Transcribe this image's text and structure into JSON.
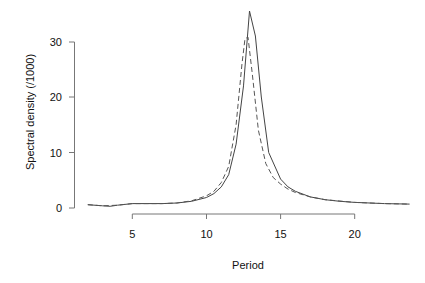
{
  "chart_data": {
    "type": "line",
    "title": "",
    "xlabel": "Period",
    "ylabel": "Spectral density (/1000)",
    "xlim": [
      2,
      23.7
    ],
    "ylim": [
      0,
      36
    ],
    "grid": false,
    "legend": null,
    "x_ticks": [
      5,
      10,
      15,
      20
    ],
    "y_ticks": [
      0,
      10,
      20,
      30
    ],
    "series": [
      {
        "name": "solid",
        "line_style": "solid",
        "color": "#444444",
        "points": [
          [
            2.0,
            0.6
          ],
          [
            3.0,
            0.4
          ],
          [
            3.5,
            0.3
          ],
          [
            4.0,
            0.5
          ],
          [
            5.0,
            0.8
          ],
          [
            6.0,
            0.8
          ],
          [
            7.0,
            0.8
          ],
          [
            8.0,
            0.9
          ],
          [
            9.0,
            1.2
          ],
          [
            10.0,
            1.9
          ],
          [
            10.5,
            2.6
          ],
          [
            11.0,
            3.8
          ],
          [
            11.5,
            6.0
          ],
          [
            12.0,
            11.5
          ],
          [
            12.5,
            22.0
          ],
          [
            12.9,
            35.5
          ],
          [
            13.3,
            31.0
          ],
          [
            13.7,
            20.0
          ],
          [
            14.2,
            10.0
          ],
          [
            15.0,
            5.2
          ],
          [
            15.5,
            3.8
          ],
          [
            16.0,
            3.0
          ],
          [
            17.0,
            2.0
          ],
          [
            18.0,
            1.5
          ],
          [
            19.0,
            1.2
          ],
          [
            20.0,
            1.0
          ],
          [
            22.0,
            0.8
          ],
          [
            23.7,
            0.7
          ]
        ]
      },
      {
        "name": "dashed",
        "line_style": "dashed",
        "color": "#555555",
        "points": [
          [
            2.0,
            0.6
          ],
          [
            3.0,
            0.4
          ],
          [
            4.0,
            0.5
          ],
          [
            5.0,
            0.8
          ],
          [
            6.0,
            0.8
          ],
          [
            7.0,
            0.8
          ],
          [
            8.0,
            0.9
          ],
          [
            9.0,
            1.3
          ],
          [
            10.0,
            2.2
          ],
          [
            10.5,
            3.0
          ],
          [
            11.0,
            4.6
          ],
          [
            11.5,
            7.5
          ],
          [
            12.0,
            15.0
          ],
          [
            12.4,
            26.0
          ],
          [
            12.6,
            30.5
          ],
          [
            12.8,
            30.8
          ],
          [
            13.1,
            24.0
          ],
          [
            13.5,
            14.0
          ],
          [
            14.0,
            8.0
          ],
          [
            14.5,
            5.5
          ],
          [
            15.0,
            4.3
          ],
          [
            15.5,
            3.4
          ],
          [
            16.0,
            2.8
          ],
          [
            17.0,
            2.0
          ],
          [
            18.0,
            1.5
          ],
          [
            20.0,
            1.0
          ],
          [
            22.0,
            0.8
          ],
          [
            23.7,
            0.7
          ]
        ]
      }
    ]
  },
  "labels": {
    "x_axis_title": "Period",
    "y_axis_title": "Spectral density (/1000)",
    "x_tick_labels": [
      "5",
      "10",
      "15",
      "20"
    ],
    "y_tick_labels": [
      "0",
      "10",
      "20",
      "30"
    ]
  }
}
